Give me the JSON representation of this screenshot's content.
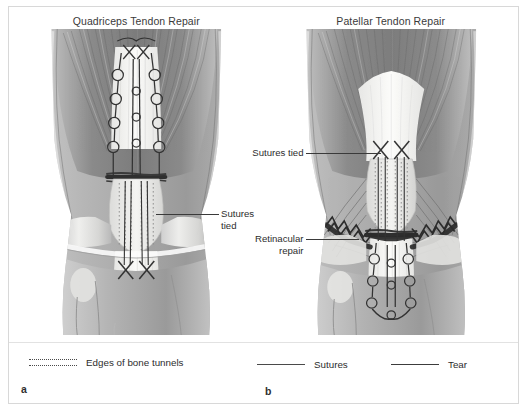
{
  "figure": {
    "panels": [
      {
        "letter": "a",
        "title": "Quadriceps Tendon Repair",
        "callouts": [
          {
            "text": "Sutures tied"
          }
        ]
      },
      {
        "letter": "b",
        "title": "Patellar Tendon Repair",
        "callouts": [
          {
            "text": "Sutures tied"
          },
          {
            "text": "Retinacular\nrepair"
          }
        ]
      }
    ],
    "legend": [
      {
        "symbol": "dotted-double-line-icon",
        "label": "Edges of bone tunnels"
      },
      {
        "symbol": "solid-line-icon",
        "label": "Sutures"
      },
      {
        "symbol": "solid-thick-line-icon",
        "label": "Tear"
      }
    ],
    "colors": {
      "frame_border": "#d8d8d8",
      "text": "#2d2d2d",
      "leader_line": "#3a3a3a",
      "suture": "#3c3c3c",
      "bone_light": "#efefef",
      "muscle_mid": "#9b9b9b",
      "muscle_dark": "#6f6f6f",
      "tendon_white": "#f7f7f5"
    }
  }
}
